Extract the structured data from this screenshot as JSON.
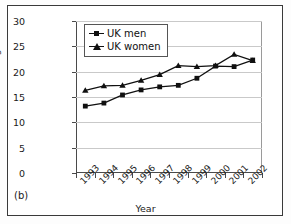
{
  "figure": {
    "panel_label": "(b)"
  },
  "chart_data": {
    "type": "line",
    "title": "",
    "xlabel": "Year",
    "ylabel": "Percentage",
    "categories": [
      "1993",
      "1994",
      "1995",
      "1996",
      "1997",
      "1998",
      "1999",
      "2000",
      "2001",
      "2002"
    ],
    "x": [
      1993,
      1994,
      1995,
      1996,
      1997,
      1998,
      1999,
      2000,
      2001,
      2002
    ],
    "ylim": [
      0,
      30
    ],
    "yticks": [
      0,
      5,
      10,
      15,
      20,
      25,
      30
    ],
    "ytick_labels": [
      "0",
      "5",
      "10",
      "15",
      "20",
      "25",
      "30"
    ],
    "grid": true,
    "legend_position": "upper left",
    "series": [
      {
        "name": "UK men",
        "marker": "square",
        "color": "#101010",
        "values": [
          13.2,
          13.8,
          15.4,
          16.4,
          17.0,
          17.3,
          18.7,
          21.1,
          21.0,
          22.3
        ]
      },
      {
        "name": "UK women",
        "marker": "triangle",
        "color": "#101010",
        "values": [
          16.3,
          17.2,
          17.3,
          18.3,
          19.4,
          21.2,
          21.0,
          21.2,
          23.4,
          22.2
        ]
      }
    ]
  }
}
